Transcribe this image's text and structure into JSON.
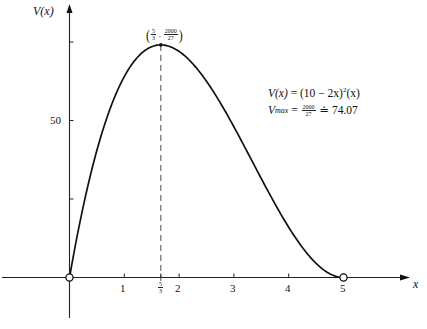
{
  "chart_data": {
    "type": "line",
    "title": "",
    "xlabel": "x",
    "ylabel": "V(x)",
    "function": "V(x) = (10 - 2x)^2 (x)",
    "xlim": [
      -0.2,
      6.2
    ],
    "ylim": [
      -15,
      87
    ],
    "x_ticks": [
      {
        "value": 1,
        "label": "1"
      },
      {
        "value": 1.6667,
        "label": "5/3"
      },
      {
        "value": 2,
        "label": "2"
      },
      {
        "value": 3,
        "label": "3"
      },
      {
        "value": 4,
        "label": "4"
      },
      {
        "value": 5,
        "label": "5"
      }
    ],
    "y_ticks": [
      {
        "value": 25,
        "label": ""
      },
      {
        "value": 50,
        "label": "50"
      },
      {
        "value": 75,
        "label": ""
      }
    ],
    "grid": false,
    "series": [
      {
        "name": "V(x)",
        "x": [
          0,
          0.25,
          0.5,
          0.75,
          1,
          1.25,
          1.5,
          1.6667,
          2,
          2.25,
          2.5,
          2.75,
          3,
          3.25,
          3.5,
          3.75,
          4,
          4.25,
          4.5,
          4.75,
          5
        ],
        "values": [
          0,
          22.56,
          40.5,
          54.19,
          64,
          70.31,
          73.5,
          74.07,
          72,
          68.06,
          62.5,
          55.69,
          48,
          39.81,
          31.5,
          23.44,
          16,
          9.56,
          4.5,
          1.19,
          0
        ]
      }
    ],
    "annotations": {
      "max_point": {
        "x": 1.6667,
        "y": 74.07,
        "label_x_num": "5",
        "label_x_den": "3",
        "label_y_num": "2000",
        "label_y_den": "27"
      },
      "open_endpoints": [
        {
          "x": 0,
          "y": 0
        },
        {
          "x": 5,
          "y": 0
        }
      ],
      "dashed_line_at_x": 1.6667
    },
    "formula_line1": {
      "lhs": "V(x)",
      "eq": " = (10 − 2x)",
      "exp": "2",
      "tail": "(x)"
    },
    "formula_line2": {
      "lhs": "V",
      "sub": "max",
      "eq": " = ",
      "num": "2000",
      "den": "27",
      "approx": " ≐ 74.07"
    }
  },
  "labels": {
    "y_axis": "V(x)",
    "x_axis": "x",
    "tick_50": "50",
    "tick_1": "1",
    "tick_2": "2",
    "tick_3": "3",
    "tick_4": "4",
    "tick_5": "5",
    "tick_53_num": "5",
    "tick_53_den": "3"
  }
}
